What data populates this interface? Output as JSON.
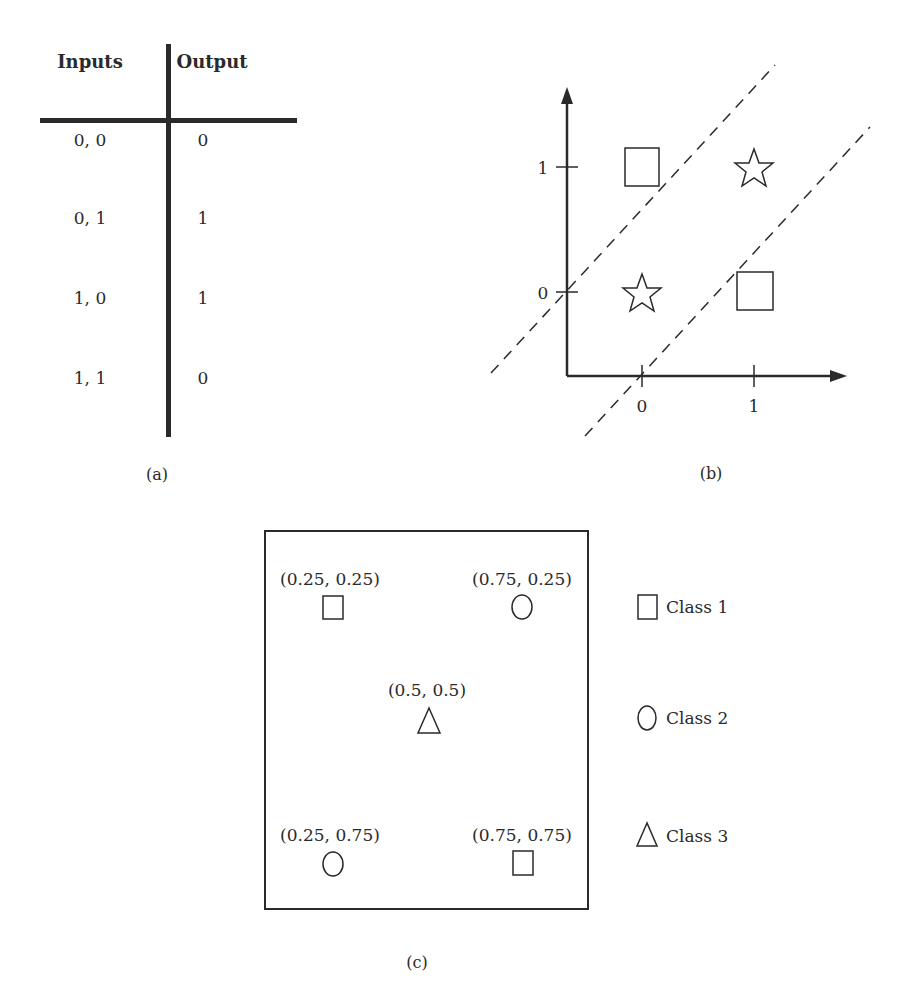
{
  "panel_a": {
    "caption": "(a)",
    "headers": {
      "inputs": "Inputs",
      "output": "Output"
    },
    "rows": [
      {
        "inputs": "0, 0",
        "output": "0"
      },
      {
        "inputs": "0, 1",
        "output": "1"
      },
      {
        "inputs": "1, 0",
        "output": "1"
      },
      {
        "inputs": "1, 1",
        "output": "0"
      }
    ]
  },
  "panel_b": {
    "caption": "(b)",
    "x_ticks": [
      "0",
      "1"
    ],
    "y_ticks": [
      "0",
      "1"
    ],
    "points": [
      {
        "x": 0,
        "y": 1,
        "marker": "square"
      },
      {
        "x": 1,
        "y": 1,
        "marker": "star"
      },
      {
        "x": 0,
        "y": 0,
        "marker": "star"
      },
      {
        "x": 1,
        "y": 0,
        "marker": "square"
      }
    ],
    "decision_boundaries": "two parallel dashed lines with slope +1"
  },
  "panel_c": {
    "caption": "(c)",
    "points": [
      {
        "label": "(0.25, 0.25)",
        "marker": "square"
      },
      {
        "label": "(0.75, 0.25)",
        "marker": "circle"
      },
      {
        "label": "(0.5, 0.5)",
        "marker": "triangle"
      },
      {
        "label": "(0.25, 0.75)",
        "marker": "circle"
      },
      {
        "label": "(0.75, 0.75)",
        "marker": "square"
      }
    ],
    "legend": [
      {
        "marker": "square",
        "label": "Class 1"
      },
      {
        "marker": "circle",
        "label": "Class 2"
      },
      {
        "marker": "triangle",
        "label": "Class 3"
      }
    ]
  },
  "colors": {
    "ink": "#2a2a2a",
    "background": "#ffffff"
  }
}
